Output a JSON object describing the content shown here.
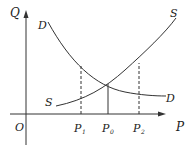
{
  "diagram": {
    "title": "",
    "axes": {
      "y_label": "Q",
      "x_label": "P",
      "origin_label": "O"
    },
    "curves": {
      "demand": {
        "label_top": "D",
        "label_bottom": "D"
      },
      "supply": {
        "label_top": "S",
        "label_bottom": "S"
      }
    },
    "price_marks": {
      "p1": {
        "label": "P",
        "sub": "1",
        "style": "dashed"
      },
      "p0": {
        "label": "P",
        "sub": "0",
        "style": "solid"
      },
      "p2": {
        "label": "P",
        "sub": "2",
        "style": "dashed"
      }
    },
    "colors": {
      "line": "#333333",
      "background": "#ffffff"
    }
  }
}
